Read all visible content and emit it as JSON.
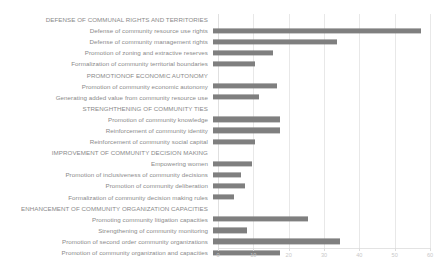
{
  "chart_data": {
    "type": "bar",
    "orientation": "horizontal",
    "title": "",
    "subtitle": "",
    "xlabel": "",
    "ylabel": "",
    "xlim": [
      0,
      60
    ],
    "xticks": [
      0,
      10,
      20,
      30,
      40,
      50,
      60
    ],
    "xtick_labels": [
      "0",
      "10",
      "20",
      "30",
      "40",
      "50",
      "60"
    ],
    "grid": true,
    "legend": false,
    "bar_color": "#7f7f7f",
    "categories": [
      "DEFENSE OF COMMUNAL RIGHTS AND TERRITORIES",
      "Defense of community resource use rights",
      "Defense of community management rights",
      "Promotion of zoning and extractive reserves",
      "Formalization of community territorial boundaries",
      "PROMOTIONOF ECONOMIC AUTONOMY",
      "Promotion of community economic autonomy",
      "Generating added value from community resource use",
      "STRENGHTHENING OF COMMUNITY TIES",
      "Promotion of community knowledge",
      "Reinforcement of community identity",
      "Reinforcement of community social capital",
      "IMPROVEMENT OF COMMUNITY DECISION MAKING",
      "Empowering women",
      "Promotion of inclusiveness of community decisions",
      "Promotion of community deliberation",
      "Formalization of community decision making rules",
      "ENHANCEMENT OF COMMUNITY ORGANIZATION CAPACITIES",
      "Promoting community litigation capacities",
      "Strengthening of community monitoring",
      "Promotion of second order community organizations",
      "Promotion of community organization and capacities"
    ],
    "values": [
      null,
      59,
      35,
      17,
      12,
      null,
      18,
      13,
      null,
      19,
      19,
      12,
      null,
      11,
      8,
      9,
      6,
      null,
      27,
      9.5,
      36,
      19
    ],
    "is_header": [
      true,
      false,
      false,
      false,
      false,
      true,
      false,
      false,
      true,
      false,
      false,
      false,
      true,
      false,
      false,
      false,
      false,
      true,
      false,
      false,
      false,
      false
    ]
  }
}
